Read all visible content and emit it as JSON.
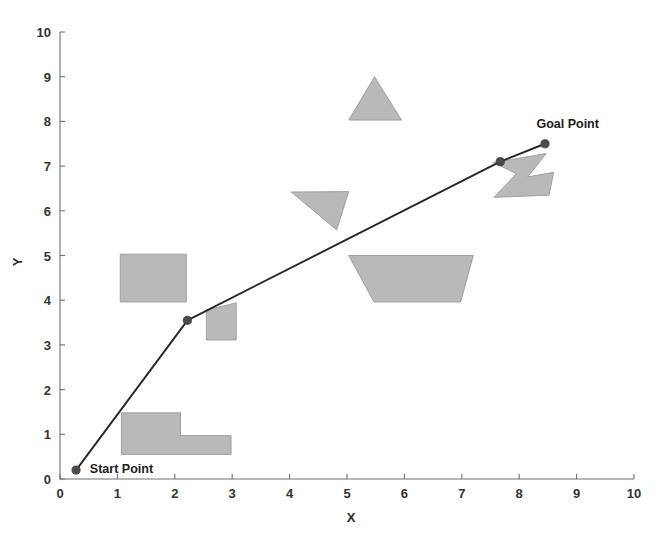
{
  "chart_data": {
    "type": "line",
    "title": "",
    "subtitle": "",
    "xlabel": "X",
    "ylabel": "Y",
    "xlim": [
      0,
      10
    ],
    "ylim": [
      0,
      10
    ],
    "xticks": [
      0,
      1,
      2,
      3,
      4,
      5,
      6,
      7,
      8,
      9,
      10
    ],
    "yticks": [
      0,
      1,
      2,
      3,
      4,
      5,
      6,
      7,
      8,
      9,
      10
    ],
    "xtick_labels": [
      "0",
      "1",
      "2",
      "3",
      "4",
      "5",
      "6",
      "7",
      "8",
      "9",
      "10"
    ],
    "ytick_labels": [
      "0",
      "1",
      "2",
      "3",
      "4",
      "5",
      "6",
      "7",
      "8",
      "9",
      "10"
    ],
    "grid": false,
    "legend": "none",
    "series": [
      {
        "name": "planned-path",
        "type": "line",
        "color": "#262626",
        "marker": "circle",
        "marker_color": "#4a4a4a",
        "x": [
          0.28,
          2.22,
          7.67,
          8.45
        ],
        "y": [
          0.2,
          3.55,
          7.1,
          7.5
        ]
      }
    ],
    "annotations": [
      {
        "name": "start-point-label",
        "text": "Start Point",
        "x": 0.52,
        "y": 0.22
      },
      {
        "name": "goal-point-label",
        "text": "Goal Point",
        "x": 8.3,
        "y": 7.95
      }
    ],
    "obstacles": [
      {
        "name": "rectangle-obstacle",
        "shape": "polygon",
        "fill": "#b9b9b9",
        "points": [
          [
            1.05,
            5.03
          ],
          [
            2.2,
            5.03
          ],
          [
            2.2,
            3.96
          ],
          [
            1.05,
            3.96
          ]
        ]
      },
      {
        "name": "l-shape-obstacle",
        "shape": "polygon",
        "fill": "#b9b9b9",
        "points": [
          [
            1.07,
            1.48
          ],
          [
            2.1,
            1.48
          ],
          [
            2.1,
            0.97
          ],
          [
            2.98,
            0.97
          ],
          [
            2.98,
            0.55
          ],
          [
            1.07,
            0.55
          ]
        ]
      },
      {
        "name": "quad-obstacle",
        "shape": "polygon",
        "fill": "#b9b9b9",
        "points": [
          [
            2.55,
            3.78
          ],
          [
            3.07,
            3.94
          ],
          [
            3.07,
            3.11
          ],
          [
            2.55,
            3.11
          ]
        ]
      },
      {
        "name": "thin-triangle-obstacle",
        "shape": "polygon",
        "fill": "#b9b9b9",
        "points": [
          [
            4.03,
            6.42
          ],
          [
            5.03,
            6.43
          ],
          [
            4.82,
            5.57
          ]
        ]
      },
      {
        "name": "triangle-obstacle",
        "shape": "polygon",
        "fill": "#b9b9b9",
        "points": [
          [
            5.48,
            9.0
          ],
          [
            5.95,
            8.03
          ],
          [
            5.03,
            8.03
          ]
        ]
      },
      {
        "name": "trapezoid-obstacle",
        "shape": "polygon",
        "fill": "#b9b9b9",
        "points": [
          [
            5.03,
            5.0
          ],
          [
            7.2,
            5.0
          ],
          [
            6.98,
            3.96
          ],
          [
            5.47,
            3.96
          ]
        ]
      },
      {
        "name": "zigzag-obstacle",
        "shape": "polygon",
        "fill": "#b9b9b9",
        "points": [
          [
            7.55,
            7.08
          ],
          [
            8.47,
            7.28
          ],
          [
            8.15,
            6.76
          ],
          [
            8.6,
            6.86
          ],
          [
            8.52,
            6.35
          ],
          [
            7.56,
            6.3
          ],
          [
            7.95,
            6.83
          ]
        ]
      }
    ]
  },
  "axes": {
    "x_title": "X",
    "y_title": "Y"
  }
}
